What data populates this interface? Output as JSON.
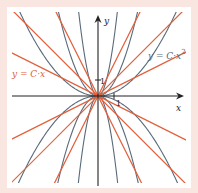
{
  "diagram": {
    "title": "",
    "colors": {
      "frame": "#f9e6e0",
      "plot_background": "#ffffff",
      "axis": "#222222",
      "line_family": "#e0603a",
      "parabola_family": "#5a6a7a"
    },
    "axes": {
      "x_label": "x",
      "y_label": "y",
      "x_tick_label": "1",
      "y_tick_label": "1"
    },
    "labels": {
      "line_family": "y = C·x",
      "parabola_family": "y = C·x²"
    },
    "line_family_slopes": [
      0.5,
      1,
      2,
      -0.5,
      -1,
      -2
    ],
    "parabola_family_coefficients": [
      0.22,
      0.86,
      3.6,
      -0.22,
      -0.86,
      -3.6
    ]
  }
}
